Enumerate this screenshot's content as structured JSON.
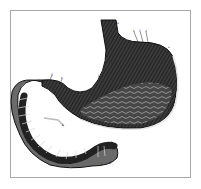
{
  "image": {
    "subject": "anatomical engraving of the human stomach with duodenum",
    "style": "black-and-white copperplate engraving",
    "colors": {
      "ink": "#1a1a1a",
      "mid": "#5a5a5a",
      "light": "#bdbdbd",
      "paper": "#ffffff",
      "frame": "#a8a8a8"
    }
  },
  "labels": [
    {
      "id": "a",
      "text": "a",
      "x": 117,
      "y": 22
    },
    {
      "id": "b",
      "text": "b",
      "x": 133,
      "y": 30
    },
    {
      "id": "c",
      "text": "c",
      "x": 139,
      "y": 29
    },
    {
      "id": "d",
      "text": "d",
      "x": 145,
      "y": 30
    },
    {
      "id": "e",
      "text": "e",
      "x": 168,
      "y": 46
    },
    {
      "id": "f",
      "text": "f",
      "x": 98,
      "y": 75
    },
    {
      "id": "g",
      "text": "g",
      "x": 51,
      "y": 73
    },
    {
      "id": "h",
      "text": "h",
      "x": 61,
      "y": 77
    },
    {
      "id": "i",
      "text": "i",
      "x": 149,
      "y": 121
    },
    {
      "id": "k",
      "text": "k",
      "x": 62,
      "y": 124
    },
    {
      "id": "l",
      "text": "l",
      "x": 101,
      "y": 163
    },
    {
      "id": "m",
      "text": "m",
      "x": 108,
      "y": 162
    }
  ]
}
